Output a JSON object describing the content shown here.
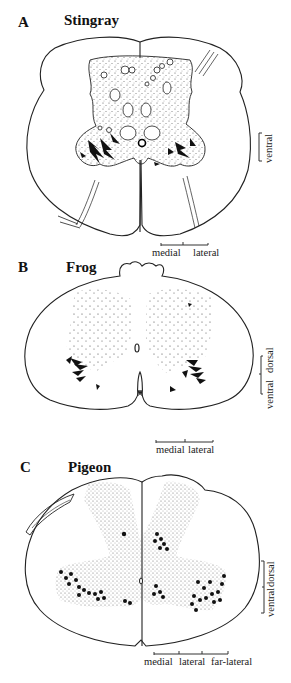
{
  "figure": {
    "panels": [
      {
        "letter": "A",
        "title": "Stingray",
        "horizontal_scale": [
          "medial",
          "lateral"
        ],
        "vertical_scale": [
          "ventral"
        ]
      },
      {
        "letter": "B",
        "title": "Frog",
        "horizontal_scale": [
          "medial",
          "lateral"
        ],
        "vertical_scale": [
          "ventral",
          "dorsal"
        ]
      },
      {
        "letter": "C",
        "title": "Pigeon",
        "horizontal_scale": [
          "medial",
          "lateral",
          "far-lateral"
        ],
        "vertical_scale": [
          "ventral",
          "dorsal"
        ]
      }
    ]
  }
}
